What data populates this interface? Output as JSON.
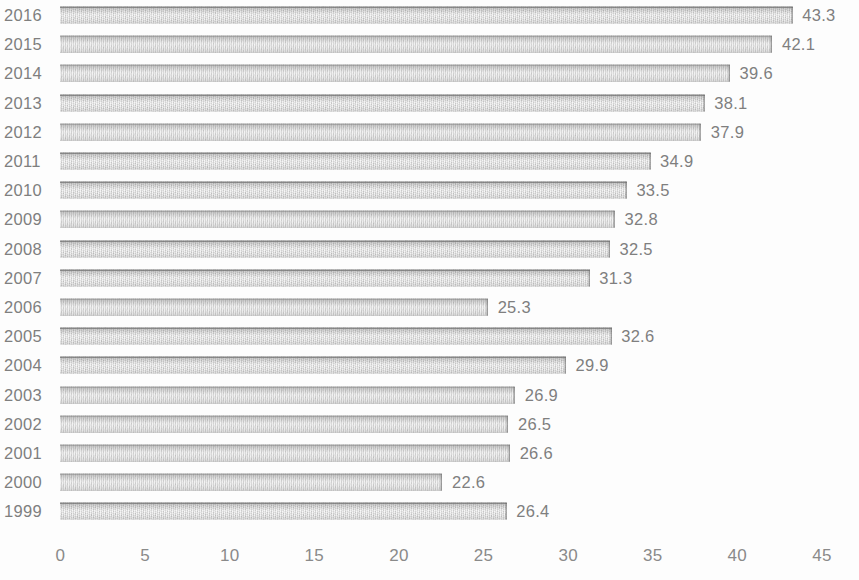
{
  "chart_data": {
    "type": "bar",
    "orientation": "horizontal",
    "title": "",
    "subtitle": "",
    "xlabel": "",
    "ylabel": "",
    "xlim": [
      0,
      45
    ],
    "x_ticks": [
      "0",
      "5",
      "10",
      "15",
      "20",
      "25",
      "30",
      "35",
      "40",
      "45"
    ],
    "grid": false,
    "legend": null,
    "bar_color": "#d3d3d3",
    "text_color": "#7f7f7f",
    "categories": [
      "2016",
      "2015",
      "2014",
      "2013",
      "2012",
      "2011",
      "2010",
      "2009",
      "2008",
      "2007",
      "2006",
      "2005",
      "2004",
      "2003",
      "2002",
      "2001",
      "2000",
      "1999"
    ],
    "values": [
      43.3,
      42.1,
      39.6,
      38.1,
      37.9,
      34.9,
      33.5,
      32.8,
      32.5,
      31.3,
      25.3,
      32.6,
      29.9,
      26.9,
      26.5,
      26.6,
      22.6,
      26.4
    ],
    "data_labels": [
      "43.3",
      "42.1",
      "39.6",
      "38.1",
      "37.9",
      "34.9",
      "33.5",
      "32.8",
      "32.5",
      "31.3",
      "25.3",
      "32.6",
      "29.9",
      "26.9",
      "26.5",
      "26.6",
      "22.6",
      "26.4"
    ],
    "rows": [
      {
        "category": "2016",
        "value": 43.3,
        "label": "43.3"
      },
      {
        "category": "2015",
        "value": 42.1,
        "label": "42.1"
      },
      {
        "category": "2014",
        "value": 39.6,
        "label": "39.6"
      },
      {
        "category": "2013",
        "value": 38.1,
        "label": "38.1"
      },
      {
        "category": "2012",
        "value": 37.9,
        "label": "37.9"
      },
      {
        "category": "2011",
        "value": 34.9,
        "label": "34.9"
      },
      {
        "category": "2010",
        "value": 33.5,
        "label": "33.5"
      },
      {
        "category": "2009",
        "value": 32.8,
        "label": "32.8"
      },
      {
        "category": "2008",
        "value": 32.5,
        "label": "32.5"
      },
      {
        "category": "2007",
        "value": 31.3,
        "label": "31.3"
      },
      {
        "category": "2006",
        "value": 25.3,
        "label": "25.3"
      },
      {
        "category": "2005",
        "value": 32.6,
        "label": "32.6"
      },
      {
        "category": "2004",
        "value": 29.9,
        "label": "29.9"
      },
      {
        "category": "2003",
        "value": 26.9,
        "label": "26.9"
      },
      {
        "category": "2002",
        "value": 26.5,
        "label": "26.5"
      },
      {
        "category": "2001",
        "value": 26.6,
        "label": "26.6"
      },
      {
        "category": "2000",
        "value": 22.6,
        "label": "22.6"
      },
      {
        "category": "1999",
        "value": 26.4,
        "label": "26.4"
      }
    ]
  }
}
